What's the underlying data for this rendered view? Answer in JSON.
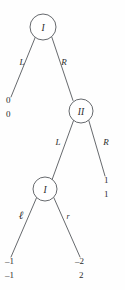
{
  "diagram": {
    "type": "extensive-form-game-tree",
    "background_color": "#fefefe",
    "line_color": "#55585c",
    "text_color": "#2b2b2b",
    "nodes": [
      {
        "id": "root",
        "label": "I",
        "player": "I",
        "cx": 43,
        "cy": 27,
        "r": 13
      },
      {
        "id": "n2",
        "label": "II",
        "player": "II",
        "cx": 81,
        "cy": 111,
        "r": 12
      },
      {
        "id": "n3",
        "label": "I",
        "player": "I",
        "cx": 45,
        "cy": 189,
        "r": 12
      }
    ],
    "edges": [
      {
        "id": "e-root-left",
        "from": "root",
        "to": "t1",
        "label": "L",
        "label_x": 22,
        "label_y": 62,
        "style": "italic"
      },
      {
        "id": "e-root-right",
        "from": "root",
        "to": "n2",
        "label": "R",
        "label_x": 64,
        "label_y": 62,
        "style": "italic"
      },
      {
        "id": "e-n2-left",
        "from": "n2",
        "to": "n3",
        "label": "L",
        "label_x": 58,
        "label_y": 142,
        "style": "italic"
      },
      {
        "id": "e-n2-right",
        "from": "n2",
        "to": "t2",
        "label": "R",
        "label_x": 106,
        "label_y": 142,
        "style": "italic"
      },
      {
        "id": "e-n3-left",
        "from": "n3",
        "to": "t3",
        "label": "ℓ",
        "label_x": 21,
        "label_y": 215,
        "style": "script"
      },
      {
        "id": "e-n3-right",
        "from": "n3",
        "to": "t4",
        "label": "r",
        "label_x": 68,
        "label_y": 216,
        "style": "italic-small"
      }
    ],
    "terminals": [
      {
        "id": "t1",
        "top": "0",
        "bottom": "0",
        "x": 6,
        "top_y": 100,
        "bottom_y": 114,
        "align": "start"
      },
      {
        "id": "t2",
        "top": "1",
        "bottom": "1",
        "x": 105,
        "top_y": 180,
        "bottom_y": 194,
        "align": "start"
      },
      {
        "id": "t3",
        "top": "–1",
        "bottom": "–1",
        "x": 5,
        "top_y": 261,
        "bottom_y": 275,
        "align": "start"
      },
      {
        "id": "t4",
        "top": "–2",
        "bottom": "2",
        "x": 76,
        "top_y": 261,
        "bottom_y": 275,
        "align": "start"
      }
    ],
    "paths": {
      "root_to_t1": "M 35.2 37.4 L 11 97",
      "root_to_n2": "M 51.8 37.1 L 73.0 100.5",
      "n2_to_n3": "M 73.6 120.4 L 52.0 179.9",
      "n2_to_t2": "M 88.8 120.5 L 105 176",
      "n3_to_t3": "M 36.7 197.4 L 11 257",
      "n3_to_t4": "M 53.8 197.6 L 80 257"
    }
  }
}
